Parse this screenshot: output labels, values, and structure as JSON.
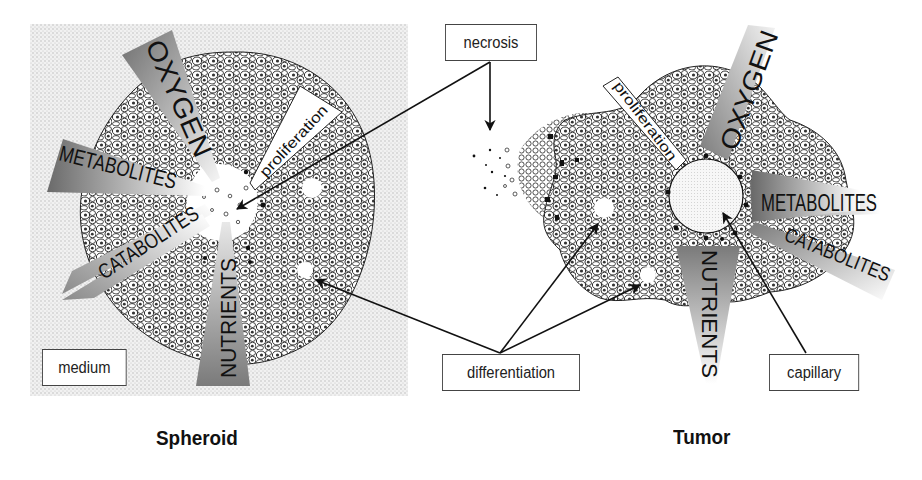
{
  "figure": {
    "panels": [
      {
        "id": "spheroid",
        "caption": "Spheroid",
        "background_label": "medium",
        "gradients": [
          {
            "label": "OXYGEN"
          },
          {
            "label": "METABOLITES"
          },
          {
            "label": "CATABOLITES"
          },
          {
            "label": "NUTRIENTS"
          },
          {
            "label": "proliferation"
          }
        ]
      },
      {
        "id": "tumor",
        "caption": "Tumor",
        "vessel_label": "capillary",
        "gradients": [
          {
            "label": "OXYGEN"
          },
          {
            "label": "METABOLITES"
          },
          {
            "label": "CATABOLITES"
          },
          {
            "label": "NUTRIENTS"
          },
          {
            "label": "proliferation"
          }
        ]
      }
    ],
    "shared_callouts": {
      "necrosis": "necrosis",
      "differentiation": "differentiation"
    },
    "colors": {
      "medium_stipple": "#d8d8d8",
      "wedge_dark": "#7a7a7a",
      "wedge_light": "#f2f2f2",
      "cell_outline": "#1a1a1a",
      "line": "#111111"
    }
  }
}
